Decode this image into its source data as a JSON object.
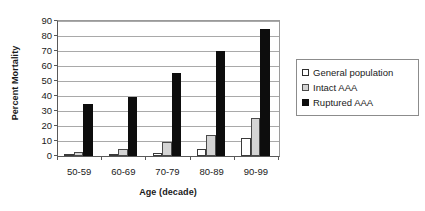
{
  "chart_data": {
    "type": "bar",
    "title": "",
    "xlabel": "Age (decade)",
    "ylabel": "Percent Mortality",
    "categories": [
      "50-59",
      "60-69",
      "70-79",
      "80-89",
      "90-99"
    ],
    "series": [
      {
        "name": "General population",
        "values": [
          0.5,
          0.5,
          2,
          4.5,
          12
        ],
        "swatch": "open-square-white",
        "color": "#ffffff"
      },
      {
        "name": "Intact AAA",
        "values": [
          3,
          5,
          9.5,
          14,
          25.5
        ],
        "swatch": "filled-square-gray",
        "color": "#d4d4d4"
      },
      {
        "name": "Ruptured AAA",
        "values": [
          35,
          39.5,
          55.5,
          70,
          85
        ],
        "swatch": "filled-square-black",
        "color": "#0d0d0d"
      }
    ],
    "ylim": [
      0,
      90
    ],
    "yticks": [
      0,
      10,
      20,
      30,
      40,
      50,
      60,
      70,
      80,
      90
    ],
    "ytick_labels": [
      "0",
      "10",
      "20",
      "30",
      "40",
      "50",
      "60",
      "70",
      "80",
      "90"
    ],
    "grid": "horizontal",
    "legend_position": "right",
    "legend_entries": [
      "General population",
      "Intact AAA",
      "Ruptured AAA"
    ]
  }
}
